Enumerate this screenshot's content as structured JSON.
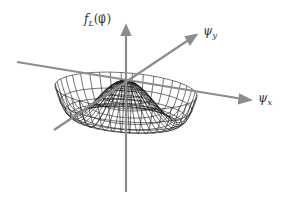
{
  "diagram": {
    "axes": {
      "vertical": {
        "label_main": "f",
        "label_sub": "L",
        "label_arg": "(ψ⃗)"
      },
      "y_axis": {
        "label_main": "ψ",
        "label_sub": "y"
      },
      "x_axis": {
        "label_main": "ψ",
        "label_sub": "x"
      }
    },
    "colors": {
      "axis": "#8c8c8c",
      "mesh": "#1a1a1a",
      "background": "#ffffff"
    }
  }
}
